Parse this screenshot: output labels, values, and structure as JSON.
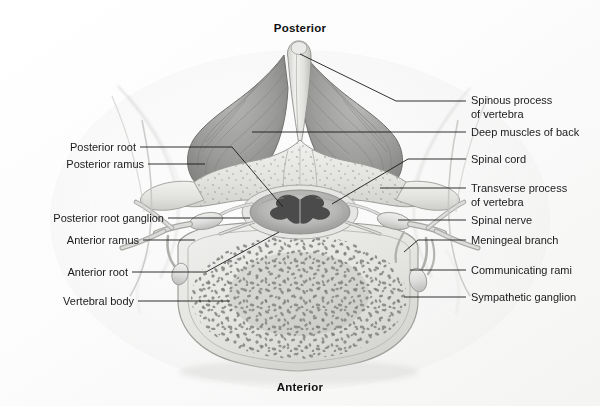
{
  "figure": {
    "width": 600,
    "height": 406,
    "background_color": "#fdfdfd"
  },
  "orientation": {
    "posterior": "Posterior",
    "anterior": "Anterior"
  },
  "labels_left": [
    {
      "text": "Posterior root",
      "x": 33,
      "y": 141,
      "line_from_x": 140,
      "line_from_y": 147,
      "line_to_x": 232,
      "line_to_y": 147,
      "elbow_x": 232,
      "elbow_y": 147,
      "tip_x": 283,
      "tip_y": 207
    },
    {
      "text": "Posterior ramus",
      "x": 33,
      "y": 158,
      "line_from_x": 148,
      "line_from_y": 164,
      "line_to_x": 205,
      "line_to_y": 164,
      "elbow_x": 205,
      "elbow_y": 164,
      "tip_x": 205,
      "tip_y": 164
    },
    {
      "text": "Posterior root ganglion",
      "x": 33,
      "y": 212,
      "line_from_x": 168,
      "line_from_y": 218,
      "line_to_x": 250,
      "line_to_y": 218,
      "elbow_x": 250,
      "elbow_y": 218,
      "tip_x": 250,
      "tip_y": 218
    },
    {
      "text": "Anterior ramus",
      "x": 33,
      "y": 234,
      "line_from_x": 143,
      "line_from_y": 240,
      "line_to_x": 195,
      "line_to_y": 240,
      "elbow_x": 195,
      "elbow_y": 240,
      "tip_x": 195,
      "tip_y": 240
    },
    {
      "text": "Anterior root",
      "x": 33,
      "y": 266,
      "line_from_x": 132,
      "line_from_y": 272,
      "line_to_x": 206,
      "line_to_y": 272,
      "elbow_x": 206,
      "elbow_y": 272,
      "tip_x": 279,
      "tip_y": 232
    },
    {
      "text": "Vertebral body",
      "x": 33,
      "y": 295,
      "line_from_x": 138,
      "line_from_y": 301,
      "line_to_x": 230,
      "line_to_y": 301,
      "elbow_x": 230,
      "elbow_y": 301,
      "tip_x": 230,
      "tip_y": 301
    }
  ],
  "labels_right": [
    {
      "text": "Spinous process\nof vertebra",
      "x": 471,
      "y": 94,
      "line_from_x": 466,
      "line_from_y": 101,
      "line_to_x": 396,
      "line_to_y": 101,
      "tip_x": 300,
      "tip_y": 54
    },
    {
      "text": "Deep muscles of back",
      "x": 471,
      "y": 126,
      "line_from_x": 466,
      "line_from_y": 132,
      "line_to_x": 400,
      "line_to_y": 132,
      "tip_x": 252,
      "tip_y": 132
    },
    {
      "text": "Spinal cord",
      "x": 471,
      "y": 153,
      "line_from_x": 466,
      "line_from_y": 159,
      "line_to_x": 408,
      "line_to_y": 159,
      "tip_x": 332,
      "tip_y": 204
    },
    {
      "text": "Transverse process\nof vertebra",
      "x": 471,
      "y": 182,
      "line_from_x": 466,
      "line_from_y": 188,
      "line_to_x": 410,
      "line_to_y": 188,
      "tip_x": 380,
      "tip_y": 188
    },
    {
      "text": "Spinal nerve",
      "x": 471,
      "y": 214,
      "line_from_x": 466,
      "line_from_y": 220,
      "line_to_x": 398,
      "line_to_y": 220,
      "tip_x": 398,
      "tip_y": 220
    },
    {
      "text": "Meningeal branch",
      "x": 471,
      "y": 234,
      "line_from_x": 466,
      "line_from_y": 240,
      "line_to_x": 418,
      "line_to_y": 240,
      "tip_x": 404,
      "tip_y": 252
    },
    {
      "text": "Communicating rami",
      "x": 471,
      "y": 264,
      "line_from_x": 466,
      "line_from_y": 270,
      "line_to_x": 410,
      "line_to_y": 270,
      "tip_x": 410,
      "tip_y": 270
    },
    {
      "text": "Sympathetic ganglion",
      "x": 471,
      "y": 291,
      "line_from_x": 466,
      "line_from_y": 297,
      "line_to_x": 404,
      "line_to_y": 297,
      "tip_x": 404,
      "tip_y": 297
    }
  ],
  "anatomy": {
    "structures": [
      "spinous process of vertebra",
      "deep muscles of back",
      "vertebral arch / lamina",
      "spinal cord",
      "posterior root",
      "posterior root ganglion",
      "posterior ramus",
      "anterior root",
      "anterior ramus",
      "spinal nerve",
      "meningeal branch",
      "communicating rami",
      "sympathetic ganglion",
      "transverse process of vertebra",
      "vertebral body with trabecular bone"
    ]
  },
  "colors": {
    "background": "#fdfdfd",
    "muscle_gray": "#9a9a9a",
    "muscle_gray_dark": "#7d7d7d",
    "bone_light": "#e9e9e7",
    "bone_mid": "#cfcfcb",
    "trabecular": "#8e8e8c",
    "cord_gray": "#b9b9b7",
    "cord_dark": "#4a4a4a",
    "nerve_light": "#dcdcda",
    "line": "#1a1a1a",
    "text": "#1a1a1a",
    "soft_tissue": "#d8d8d6"
  }
}
